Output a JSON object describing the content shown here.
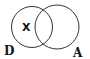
{
  "diagram": {
    "type": "venn",
    "sets": [
      {
        "name": "D",
        "label": "D"
      },
      {
        "name": "A",
        "label": "A"
      }
    ],
    "region_marker": {
      "label": "X",
      "region": "D only"
    }
  }
}
